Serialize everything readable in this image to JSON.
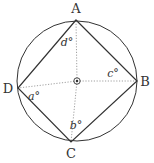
{
  "diagram": {
    "type": "inscribed-quadrilateral-in-circle",
    "colors": {
      "stroke": "#333333",
      "dotted": "#888888",
      "background": "#ffffff"
    },
    "circle": {
      "cx": 77,
      "cy": 81,
      "r": 60
    },
    "center_marker": "circled-dot",
    "vertices": [
      {
        "name": "A",
        "x": 76,
        "y": 20,
        "label_x": 76,
        "label_y": 13
      },
      {
        "name": "B",
        "x": 137,
        "y": 81,
        "label_x": 145,
        "label_y": 86
      },
      {
        "name": "C",
        "x": 71,
        "y": 142,
        "label_x": 71,
        "label_y": 158
      },
      {
        "name": "D",
        "x": 18,
        "y": 88,
        "label_x": 8,
        "label_y": 93
      }
    ],
    "angle_labels": [
      {
        "text": "d°",
        "x": 67,
        "y": 46,
        "at": "A"
      },
      {
        "text": "c°",
        "x": 113,
        "y": 77,
        "at": "B"
      },
      {
        "text": "b°",
        "x": 76,
        "y": 129,
        "at": "C"
      },
      {
        "text": "a°",
        "x": 34,
        "y": 100,
        "at": "D"
      }
    ]
  }
}
